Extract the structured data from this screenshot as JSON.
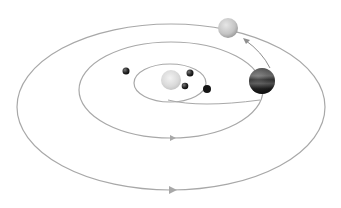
{
  "diagram": {
    "title": "",
    "colors": {
      "orbit": "#a8a8a8",
      "sun": "#d8d8d8",
      "planet_dark": "#1a1a1a",
      "outer_planet": "#c8c8c8"
    },
    "orbits": [
      {
        "name": "inner-orbit",
        "cx": 170,
        "cy": 83,
        "rx": 36,
        "ry": 19
      },
      {
        "name": "middle-orbit",
        "cx": 171,
        "cy": 90,
        "rx": 92,
        "ry": 48
      },
      {
        "name": "outer-orbit",
        "cx": 171,
        "cy": 107,
        "rx": 154,
        "ry": 83
      }
    ],
    "bodies": [
      {
        "name": "sun",
        "x": 171,
        "y": 80,
        "r": 10
      },
      {
        "name": "planet-left",
        "x": 126,
        "y": 71,
        "r": 3.5
      },
      {
        "name": "planet-inner-top",
        "x": 190,
        "y": 73,
        "r": 3.5
      },
      {
        "name": "planet-inner-bottom",
        "x": 185,
        "y": 86,
        "r": 3.3
      },
      {
        "name": "planet-inner-right",
        "x": 207,
        "y": 89,
        "r": 4
      },
      {
        "name": "jupiter",
        "x": 262,
        "y": 81,
        "r": 13
      },
      {
        "name": "outer-planet",
        "x": 228,
        "y": 28,
        "r": 10
      }
    ]
  }
}
